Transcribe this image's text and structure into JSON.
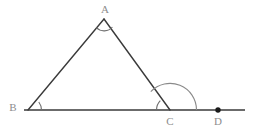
{
  "figure": {
    "kind": "euclidean-geometry-diagram",
    "canvas": {
      "width": 258,
      "height": 137,
      "background": "#ffffff"
    },
    "colors": {
      "stroke": "#3a3a3a",
      "arc": "#6e6e6e",
      "label": "#8d8d8d",
      "point_fill": "#1a1a1a"
    },
    "stroke_width": 1.4,
    "points": [
      {
        "id": "A",
        "label": "A",
        "x": 104,
        "y": 19,
        "label_x": 105,
        "label_y": 9,
        "marker": "none"
      },
      {
        "id": "B",
        "label": "B",
        "x": 28,
        "y": 110,
        "label_x": 13,
        "label_y": 107,
        "marker": "none"
      },
      {
        "id": "C",
        "label": "C",
        "x": 170,
        "y": 110,
        "label_x": 170,
        "label_y": 121,
        "marker": "none"
      },
      {
        "id": "D",
        "label": "D",
        "x": 218,
        "y": 110,
        "label_x": 218,
        "label_y": 121,
        "marker": "dot"
      }
    ],
    "segments": [
      {
        "id": "AB",
        "from": "A",
        "to": "B",
        "x1": 104,
        "y1": 19,
        "x2": 28,
        "y2": 110
      },
      {
        "id": "AC",
        "from": "A",
        "to": "C",
        "x1": 104,
        "y1": 19,
        "x2": 170,
        "y2": 110
      },
      {
        "id": "baseline",
        "from": "line-start",
        "to": "line-end",
        "x1": 24,
        "y1": 110,
        "x2": 245,
        "y2": 110
      }
    ],
    "angle_marks": [
      {
        "id": "angle-A",
        "at": "A",
        "kind": "interior",
        "radius": 11,
        "path": "M 96.3 27.7 A 11 11 0 0 0 112.0 27.3"
      },
      {
        "id": "angle-B",
        "at": "B",
        "kind": "interior",
        "radius": 13,
        "path": "M 41.0 110 A 13 13 0 0 0 38.9 102.8"
      },
      {
        "id": "angle-BCA",
        "at": "C",
        "kind": "interior",
        "radius": 13,
        "path": "M 157.0 110 A 13 13 0 0 1 160.5 101.1"
      },
      {
        "id": "angle-ACD",
        "at": "C",
        "kind": "exterior",
        "radius": 26,
        "path": "M 196.0 110 A 26 26 0 0 0 151.0 92.2"
      }
    ],
    "point_marker_radius": 2.6
  }
}
